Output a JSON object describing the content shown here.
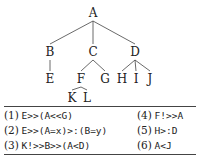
{
  "tree": {
    "nodes": [
      {
        "id": "A",
        "label": "A",
        "x": 93,
        "y": 13
      },
      {
        "id": "B",
        "label": "B",
        "x": 50,
        "y": 52
      },
      {
        "id": "C",
        "label": "C",
        "x": 93,
        "y": 52
      },
      {
        "id": "D",
        "label": "D",
        "x": 135,
        "y": 52
      },
      {
        "id": "E",
        "label": "E",
        "x": 50,
        "y": 79
      },
      {
        "id": "F",
        "label": "F",
        "x": 81,
        "y": 79
      },
      {
        "id": "G",
        "label": "G",
        "x": 105,
        "y": 79
      },
      {
        "id": "H",
        "label": "H",
        "x": 122,
        "y": 79
      },
      {
        "id": "I",
        "label": "I",
        "x": 136,
        "y": 79
      },
      {
        "id": "J",
        "label": "J",
        "x": 150,
        "y": 79
      },
      {
        "id": "K",
        "label": "K",
        "x": 72,
        "y": 98
      },
      {
        "id": "L",
        "label": "L",
        "x": 87,
        "y": 98
      }
    ],
    "edges": [
      [
        "A",
        "B"
      ],
      [
        "A",
        "C"
      ],
      [
        "A",
        "D"
      ],
      [
        "B",
        "E"
      ],
      [
        "C",
        "F"
      ],
      [
        "C",
        "G"
      ],
      [
        "D",
        "H"
      ],
      [
        "D",
        "I"
      ],
      [
        "D",
        "J"
      ],
      [
        "F",
        "K"
      ],
      [
        "F",
        "L"
      ]
    ]
  },
  "table": {
    "rows": [
      {
        "left": {
          "num": "(1)",
          "expr": "E>>(A<<G)"
        },
        "right": {
          "num": "(4)",
          "expr": "F!>>A"
        }
      },
      {
        "left": {
          "num": "(2)",
          "expr": "E>>(A=x)>:(B=y)"
        },
        "right": {
          "num": "(5)",
          "expr": "H>:D"
        }
      },
      {
        "left": {
          "num": "(3)",
          "expr": "K!>>B>>(A<D)"
        },
        "right": {
          "num": "(6)",
          "expr": "A<J"
        }
      }
    ]
  }
}
